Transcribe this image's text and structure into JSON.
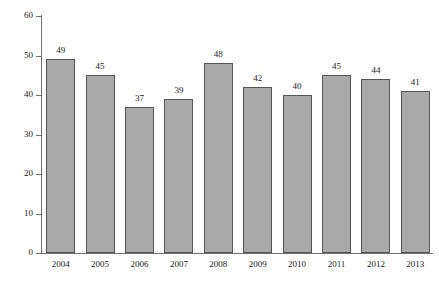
{
  "chart_data": {
    "type": "bar",
    "title": "",
    "xlabel": "",
    "ylabel": "Average concentration of NO₂ (micrograms/cubic metre)",
    "categories": [
      "2004",
      "2005",
      "2006",
      "2007",
      "2008",
      "2009",
      "2010",
      "2011",
      "2012",
      "2013"
    ],
    "values": [
      49,
      45,
      37,
      39,
      48,
      42,
      40,
      45,
      44,
      41
    ],
    "value_labels": [
      "49",
      "45",
      "37",
      "39",
      "48",
      "42",
      "40",
      "45",
      "44",
      "41"
    ],
    "ylim": [
      0,
      60
    ],
    "ytick_labels": [
      "0",
      "10",
      "20",
      "30",
      "40",
      "50",
      "60"
    ],
    "ytick_values": [
      0,
      10,
      20,
      30,
      40,
      50,
      60
    ],
    "grid": false,
    "legend": false,
    "legend_position": "none",
    "bar_color": "#a9a9a9",
    "bar_edge_color": "#555555",
    "axis_color": "#6f6f6f",
    "background_color": "#ffffff",
    "text_color": "#1a1a1a",
    "series": [
      {
        "name": "Average NO2 concentration",
        "values": [
          49,
          45,
          37,
          39,
          48,
          42,
          40,
          45,
          44,
          41
        ]
      }
    ]
  }
}
